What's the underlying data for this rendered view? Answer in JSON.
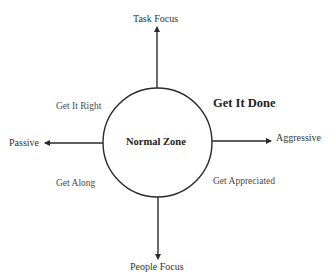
{
  "diagram": {
    "type": "quadrant-axis-diagram",
    "center": {
      "label": "Normal Zone"
    },
    "axes": {
      "top": "Task Focus",
      "bottom": "People Focus",
      "left": "Passive",
      "right": "Aggressive"
    },
    "quadrants": {
      "top_left": "Get It Right",
      "top_right": "Get It Done",
      "bottom_left": "Get Along",
      "bottom_right": "Get Appreciated"
    },
    "emphasized_quadrant": "top_right",
    "colors": {
      "line": "#2a2a2a",
      "text": "#333333",
      "background": "#ffffff"
    }
  }
}
